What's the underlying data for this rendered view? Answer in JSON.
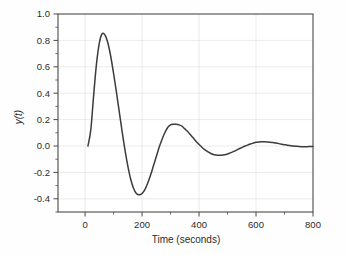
{
  "chart_data": {
    "type": "line",
    "title": "",
    "xlabel": "Time (seconds)",
    "ylabel": "y(t)",
    "xlim": [
      -95,
      800
    ],
    "ylim": [
      -0.5,
      1.0
    ],
    "xticks": [
      0,
      200,
      400,
      600,
      800
    ],
    "xtick_labels": [
      "0",
      "200",
      "400",
      "600",
      "800"
    ],
    "yticks": [
      -0.4,
      -0.2,
      0.0,
      0.2,
      0.4,
      0.6,
      0.8,
      1.0
    ],
    "ytick_labels": [
      "-0.4",
      "-0.2",
      "0.0",
      "0.2",
      "0.4",
      "0.6",
      "0.8",
      "1.0"
    ],
    "xminor_interval": 100,
    "yminor_interval": 0.1,
    "grid": true,
    "grid_color": "#dddddd",
    "legend": null,
    "line_color": "#3b3b3b",
    "series": [
      {
        "name": "y(t)",
        "description": "Underdamped damped-oscillation step response",
        "x": [
          10,
          20,
          30,
          40,
          50,
          60,
          70,
          80,
          90,
          100,
          110,
          120,
          130,
          140,
          150,
          160,
          170,
          180,
          190,
          200,
          210,
          220,
          230,
          240,
          250,
          260,
          270,
          280,
          290,
          300,
          310,
          320,
          330,
          340,
          350,
          360,
          370,
          380,
          390,
          400,
          410,
          420,
          430,
          440,
          450,
          460,
          470,
          480,
          490,
          500,
          510,
          520,
          530,
          540,
          550,
          560,
          570,
          580,
          590,
          600,
          610,
          620,
          630,
          640,
          650,
          660,
          670,
          680,
          690,
          700,
          710,
          720,
          730,
          740,
          750,
          760,
          770,
          780,
          790,
          800
        ],
        "y": [
          0.0,
          0.12,
          0.38,
          0.62,
          0.78,
          0.85,
          0.84,
          0.78,
          0.68,
          0.55,
          0.41,
          0.26,
          0.11,
          -0.03,
          -0.15,
          -0.25,
          -0.32,
          -0.36,
          -0.37,
          -0.36,
          -0.33,
          -0.28,
          -0.22,
          -0.15,
          -0.08,
          -0.01,
          0.05,
          0.1,
          0.14,
          0.16,
          0.165,
          0.165,
          0.16,
          0.15,
          0.13,
          0.11,
          0.085,
          0.06,
          0.035,
          0.012,
          -0.01,
          -0.028,
          -0.043,
          -0.055,
          -0.064,
          -0.069,
          -0.071,
          -0.07,
          -0.066,
          -0.06,
          -0.052,
          -0.043,
          -0.033,
          -0.022,
          -0.012,
          -0.002,
          0.007,
          0.015,
          0.022,
          0.028,
          0.031,
          0.032,
          0.032,
          0.031,
          0.029,
          0.026,
          0.022,
          0.018,
          0.014,
          0.01,
          0.006,
          0.003,
          0.0,
          -0.002,
          -0.004,
          -0.005,
          -0.005,
          -0.005,
          -0.004,
          -0.003
        ]
      }
    ],
    "annotations": {
      "first_peak": {
        "x": 60,
        "y": 0.85
      },
      "first_trough": {
        "x": 190,
        "y": -0.37
      },
      "second_peak": {
        "x": 325,
        "y": 0.165
      },
      "second_trough": {
        "x": 470,
        "y": -0.071
      },
      "third_peak": {
        "x": 615,
        "y": 0.032
      },
      "start_point": {
        "x": 10,
        "y": 0.0
      }
    }
  }
}
